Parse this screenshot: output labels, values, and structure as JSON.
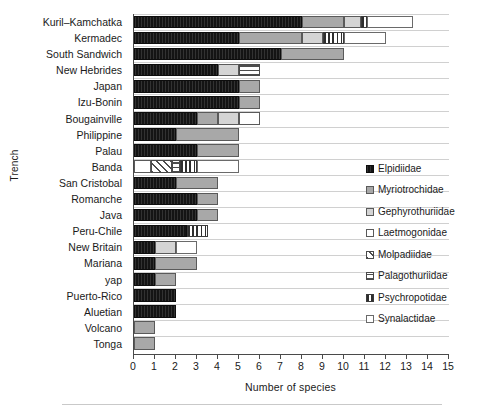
{
  "chart_data": {
    "type": "bar",
    "orientation": "horizontal",
    "stacked": true,
    "title": "",
    "xlabel": "Number of species",
    "ylabel": "Trench",
    "xlim": [
      0,
      15
    ],
    "xticks": [
      "0",
      "1",
      "2",
      "3",
      "4",
      "5",
      "6",
      "7",
      "8",
      "9",
      "10",
      "11",
      "12",
      "13",
      "14",
      "15"
    ],
    "grid": false,
    "legend_position": "right",
    "categories": [
      "Kuril–Kamchatka",
      "Kermadec",
      "South Sandwich",
      "New Hebrides",
      "Japan",
      "Izu-Bonin",
      "Bougainville",
      "Philippine",
      "Palau",
      "Banda",
      "San Cristobal",
      "Romanche",
      "Java",
      "Peru-Chile",
      "New Britain",
      "Mariana",
      "yap",
      "Puerto-Rico",
      "Aluetian",
      "Volcano",
      "Tonga"
    ],
    "series": [
      {
        "name": "Elpidiidae",
        "key": "elpidiidae",
        "color": "#141414",
        "values": [
          8,
          5,
          7,
          4,
          5,
          5,
          3,
          2,
          3,
          0,
          2,
          3,
          3,
          2.5,
          1,
          1,
          1,
          2,
          2,
          0,
          0
        ]
      },
      {
        "name": "Myriotrochidae",
        "key": "myriotrochidae",
        "color": "#a8a8a8",
        "values": [
          2,
          3,
          3,
          0,
          1,
          1,
          1,
          3,
          2,
          0,
          2,
          1,
          1,
          0,
          0,
          2,
          1,
          0,
          0,
          1,
          1
        ]
      },
      {
        "name": "Gephyrothuriidae",
        "key": "gephyrothuriidae",
        "color": "#d4d4d4",
        "values": [
          0.8,
          1,
          0,
          1,
          0,
          0,
          1,
          0,
          0,
          0,
          0,
          0,
          0,
          0,
          1,
          0,
          0,
          0,
          0,
          0,
          0
        ]
      },
      {
        "name": "Laetmogonidae",
        "key": "laetmogonidae",
        "color": "#ffffff",
        "values": [
          0,
          0,
          0,
          0,
          0,
          0,
          1,
          0,
          0,
          0.8,
          0,
          0,
          0,
          0,
          0,
          0,
          0,
          0,
          0,
          0,
          0
        ]
      },
      {
        "name": "Molpadiidae",
        "key": "molpadiidae",
        "color": "#ffffff",
        "values": [
          0,
          0,
          0,
          0,
          0,
          0,
          0,
          0,
          0,
          1,
          0,
          0,
          0,
          0,
          0,
          0,
          0,
          0,
          0,
          0,
          0
        ]
      },
      {
        "name": "Palagothuriidae",
        "key": "palagothuriidae",
        "color": "#ffffff",
        "values": [
          0,
          0,
          0,
          1,
          0,
          0,
          0,
          0,
          0,
          0.4,
          0,
          0,
          0,
          0,
          0,
          0,
          0,
          0,
          0,
          0,
          0
        ]
      },
      {
        "name": "Psychropotidae",
        "key": "psychropotidae",
        "color": "#2e2e2e",
        "values": [
          0.3,
          1,
          0,
          0,
          0,
          0,
          0,
          0,
          0,
          0.8,
          0,
          0,
          0,
          1,
          0,
          0,
          0,
          0,
          0,
          0,
          0
        ]
      },
      {
        "name": "Synalactidae",
        "key": "synalactidae",
        "color": "#ffffff",
        "values": [
          2.2,
          2,
          0,
          0,
          0,
          0,
          0,
          0,
          0,
          2,
          0,
          0,
          0,
          0,
          1,
          0,
          0,
          0,
          0,
          0,
          0
        ]
      }
    ],
    "totals": [
      13.3,
      12,
      10,
      6,
      6,
      6,
      6,
      5,
      5,
      5,
      4,
      4,
      4,
      3.5,
      3,
      3,
      2,
      2,
      2,
      1,
      1
    ]
  },
  "legend": {
    "items": [
      {
        "label": "Elpidiidae",
        "key": "elpidiidae"
      },
      {
        "label": "Myriotrochidae",
        "key": "myriotrochidae"
      },
      {
        "label": "Gephyrothuriidae",
        "key": "gephyrothuriidae"
      },
      {
        "label": "Laetmogonidae",
        "key": "laetmogonidae"
      },
      {
        "label": "Molpadiidae",
        "key": "molpadiidae"
      },
      {
        "label": "Palagothuriidae",
        "key": "palagothuriidae"
      },
      {
        "label": "Psychropotidae",
        "key": "psychropotidae"
      },
      {
        "label": "Synalactidae",
        "key": "synalactidae"
      }
    ]
  }
}
